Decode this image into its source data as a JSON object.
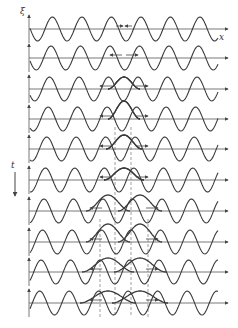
{
  "figure": {
    "axis_labels": {
      "y": "ξ",
      "x": "x",
      "time": "t"
    },
    "colors": {
      "line": "#3a3a3a",
      "axis": "#555555",
      "dash": "#777777",
      "background": "#ffffff"
    },
    "geometry": {
      "baselines": [
        29,
        58,
        89,
        119,
        149,
        180,
        211,
        242,
        272,
        303
      ],
      "axis_x_start": 29,
      "axis_x_end": 228,
      "wave_x_start": 30,
      "wave_x_end": 218,
      "period": 29.5,
      "amplitude": 12,
      "dashed_x": [
        100,
        115,
        131,
        148
      ]
    },
    "rows": [
      {
        "index": 1,
        "phase": 0.0,
        "pulse_amp": 0,
        "pulse_center": 124,
        "pulse_width": 10,
        "arrows": "converging-small",
        "dashes": 0
      },
      {
        "index": 2,
        "phase": 0.1,
        "pulse_amp": 0,
        "pulse_center": 124,
        "pulse_width": 14,
        "arrows": "diverging-small",
        "dashes": 0
      },
      {
        "index": 3,
        "phase": 0.25,
        "pulse_amp": 8,
        "pulse_center": 124,
        "pulse_width": 16,
        "arrows": "diverging",
        "dashes": 0
      },
      {
        "index": 4,
        "phase": 0.35,
        "pulse_amp": 14,
        "pulse_center": 124,
        "pulse_width": 16,
        "arrows": "diverging",
        "dashes": 2
      },
      {
        "index": 5,
        "phase": 0.5,
        "pulse_amp": 10,
        "pulse_center": 124,
        "pulse_width": 18,
        "arrows": "diverging",
        "dashes": 2
      },
      {
        "index": 6,
        "phase": 0.6,
        "pulse_amp": 0,
        "pulse_center": 124,
        "pulse_width": 20,
        "arrows": "diverging",
        "dashes": 2
      },
      {
        "index": 7,
        "phase": 0.75,
        "pulse_amp": -12,
        "pulse_center": 124,
        "pulse_width": 22,
        "arrows": "diverging-wide",
        "dashes": 2
      },
      {
        "index": 8,
        "phase": 0.85,
        "pulse_amp": -14,
        "pulse_center": 124,
        "pulse_width": 22,
        "arrows": "diverging-wide",
        "dashes": 4
      },
      {
        "index": 9,
        "phase": 0.95,
        "pulse_amp": -10,
        "pulse_center": 124,
        "pulse_width": 26,
        "arrows": "diverging-wide",
        "dashes": 4
      },
      {
        "index": 10,
        "phase": 1.0,
        "pulse_amp": 0,
        "pulse_center": 124,
        "pulse_width": 28,
        "arrows": "diverging-wide",
        "dashes": 4
      }
    ]
  }
}
